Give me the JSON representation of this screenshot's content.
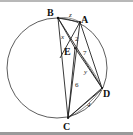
{
  "figure": {
    "circle": {
      "cx": 57,
      "cy": 68,
      "r": 50
    },
    "points": {
      "B": {
        "label": "B",
        "x": 58,
        "y": 18,
        "lx": 47,
        "ly": 16
      },
      "A": {
        "label": "A",
        "x": 80,
        "y": 22,
        "lx": 81,
        "ly": 23
      },
      "E": {
        "label": "E",
        "x": 75,
        "y": 48,
        "lx": 64,
        "ly": 55
      },
      "D": {
        "label": "D",
        "x": 102,
        "y": 88,
        "lx": 103,
        "ly": 97
      },
      "C": {
        "label": "C",
        "x": 68,
        "y": 118,
        "lx": 63,
        "ly": 130
      }
    },
    "segment_labels": [
      {
        "text": "z",
        "x": 69,
        "y": 17,
        "style": "var"
      },
      {
        "text": "x",
        "x": 61,
        "y": 39,
        "style": "var"
      },
      {
        "text": "2",
        "x": 75,
        "y": 41,
        "style": "num"
      },
      {
        "text": "7",
        "x": 83,
        "y": 55,
        "style": "num"
      },
      {
        "text": "y",
        "x": 84,
        "y": 74,
        "style": "var"
      },
      {
        "text": "6",
        "x": 75,
        "y": 87,
        "style": "num"
      },
      {
        "text": "4",
        "x": 87,
        "y": 107,
        "style": "var"
      }
    ]
  }
}
